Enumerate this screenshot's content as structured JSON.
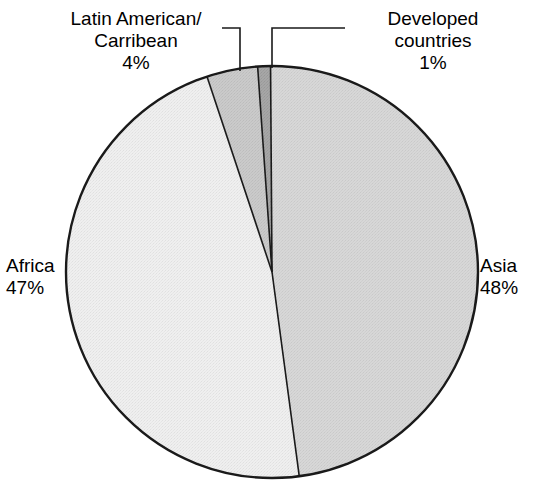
{
  "chart_data": {
    "type": "pie",
    "title": "",
    "subtitle": "",
    "xlabel": "",
    "ylabel": "",
    "grid": false,
    "legend_position": "none",
    "labels_position": "outside-with-leader-lines",
    "start_angle_deg": -4,
    "direction": "clockwise",
    "categories": [
      "Developed countries",
      "Asia",
      "Africa",
      "Latin American/Carribean"
    ],
    "values": [
      1,
      48,
      47,
      4
    ],
    "value_unit": "%",
    "slices": [
      {
        "name": "Developed countries",
        "label_lines": [
          "Developed",
          "countries",
          "1%"
        ],
        "value": 1,
        "value_text": "1%",
        "color": "#3a3a3a",
        "has_leader_line": true
      },
      {
        "name": "Asia",
        "label_lines": [
          "Asia",
          "48%"
        ],
        "value": 48,
        "value_text": "48%",
        "color": "#a8a8a8",
        "has_leader_line": false
      },
      {
        "name": "Africa",
        "label_lines": [
          "Africa",
          "47%"
        ],
        "value": 47,
        "value_text": "47%",
        "color": "#dcdcdc",
        "has_leader_line": false
      },
      {
        "name": "Latin American/Carribean",
        "label_lines": [
          "Latin American/",
          "Carribean",
          "4%"
        ],
        "value": 4,
        "value_text": "4%",
        "color": "#8a8a8a",
        "has_leader_line": true
      }
    ]
  },
  "labels": {
    "latin": {
      "line1": "Latin American/",
      "line2": "Carribean",
      "line3": "4%"
    },
    "developed": {
      "line1": "Developed",
      "line2": "countries",
      "line3": "1%"
    },
    "africa": {
      "line1": "Africa",
      "line2": "47%"
    },
    "asia": {
      "line1": "Asia",
      "line2": "48%"
    }
  },
  "colors": {
    "background": "#ffffff",
    "outline": "#1a1a1a",
    "leader_line": "#1a1a1a",
    "text": "#000000",
    "slice_developed": "#3a3a3a",
    "slice_asia": "#a8a8a8",
    "slice_africa": "#dcdcdc",
    "slice_latin": "#8a8a8a"
  }
}
